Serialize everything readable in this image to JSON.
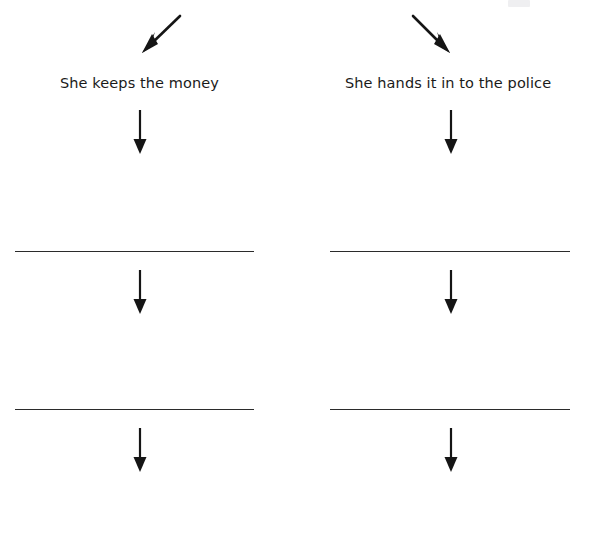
{
  "page": {
    "type": "worksheet",
    "width": 590,
    "height": 545,
    "background_color": "#ffffff",
    "ink_color": "#1a1a1a",
    "rule_color": "#2b2b2b"
  },
  "branches": [
    {
      "id": "left",
      "label": "She keeps the money",
      "incoming_arrow": {
        "name": "diagonal-arrow-down-left",
        "direction": "down-left",
        "from": [
          178,
          16
        ],
        "to": [
          144,
          49
        ]
      },
      "steps": [
        {
          "arrow": {
            "name": "arrow-down",
            "from": [
              140,
              112
            ],
            "to": [
              140,
              152
            ]
          },
          "rule": {
            "name": "answer-line",
            "value": "",
            "x1": 15,
            "x2": 254,
            "y": 251
          }
        },
        {
          "arrow": {
            "name": "arrow-down",
            "from": [
              140,
              272
            ],
            "to": [
              140,
              312
            ]
          },
          "rule": {
            "name": "answer-line",
            "value": "",
            "x1": 15,
            "x2": 254,
            "y": 409
          }
        },
        {
          "arrow": {
            "name": "arrow-down",
            "from": [
              140,
              430
            ],
            "to": [
              140,
              470
            ]
          },
          "rule": null
        }
      ]
    },
    {
      "id": "right",
      "label": "She hands it in to the police",
      "incoming_arrow": {
        "name": "diagonal-arrow-down-right",
        "direction": "down-right",
        "from": [
          412,
          16
        ],
        "to": [
          445,
          49
        ]
      },
      "steps": [
        {
          "arrow": {
            "name": "arrow-down",
            "from": [
              451,
              112
            ],
            "to": [
              451,
              152
            ]
          },
          "rule": {
            "name": "answer-line",
            "value": "",
            "x1": 330,
            "x2": 570,
            "y": 251
          }
        },
        {
          "arrow": {
            "name": "arrow-down",
            "from": [
              451,
              272
            ],
            "to": [
              451,
              312
            ]
          },
          "rule": {
            "name": "answer-line",
            "value": "",
            "x1": 330,
            "x2": 570,
            "y": 409
          }
        },
        {
          "arrow": {
            "name": "arrow-down",
            "from": [
              451,
              430
            ],
            "to": [
              451,
              470
            ]
          },
          "rule": null
        }
      ]
    }
  ],
  "labels": {
    "left_x": 60,
    "left_y": 76,
    "right_x": 345,
    "right_y": 76
  },
  "artifact": {
    "name": "cut-off-text-fragment",
    "x": 508,
    "y": 0,
    "width": 22,
    "height": 7
  }
}
